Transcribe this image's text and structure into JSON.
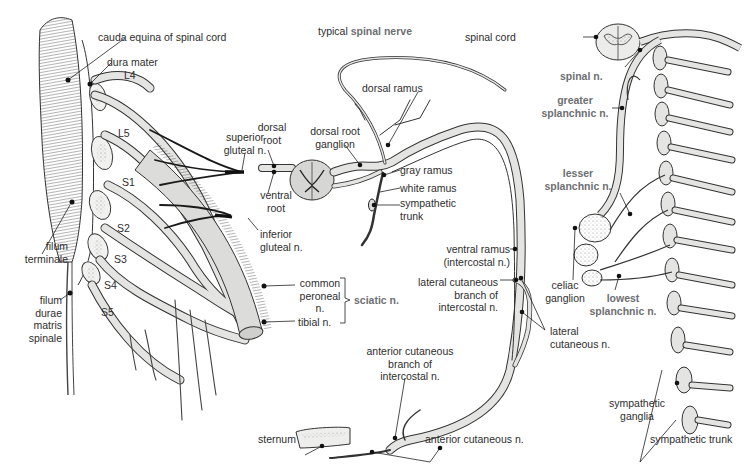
{
  "title": {
    "prefix": "typical ",
    "emphasis": "spinal nerve"
  },
  "colors": {
    "background": "#ffffff",
    "nerve_fill": "#e4e4e2",
    "outline": "#2a2a2a",
    "dark_nerve": "#1a1a1a",
    "emphasis_label": "#6d6f72",
    "text": "#2e2e2e"
  },
  "panels": {
    "sacral_plexus": {
      "labels": {
        "cauda_equina": "cauda equina of spinal cord",
        "dura_mater": "dura mater",
        "L4": "L4",
        "L5": "L5",
        "S1": "S1",
        "S2": "S2",
        "S3": "S3",
        "S4": "S4",
        "S5": "S5",
        "filum_terminale": "filum\nterminale",
        "filum_durae": "filum\ndurae\nmatris\nspinale",
        "superior_gluteal": "superior\ngluteal n.",
        "inferior_gluteal": "inferior\ngluteal n.",
        "common_peroneal": "common\nperoneal\nn.",
        "tibial": "tibial n.",
        "sciatic": "sciatic n."
      }
    },
    "typical_spinal_nerve": {
      "labels": {
        "dorsal_root": "dorsal\nroot",
        "dorsal_root_ganglion": "dorsal root\nganglion",
        "ventral_root": "ventral\nroot",
        "dorsal_ramus": "dorsal ramus",
        "gray_ramus": "gray ramus",
        "white_ramus": "white ramus",
        "sympathetic_trunk": "sympathetic\ntrunk",
        "ventral_ramus": "ventral ramus\n(intercostal n.)",
        "lateral_cutaneous_branch": "lateral cutaneous\nbranch of\nintercostal n.",
        "lateral_cutaneous_n": "lateral\ncutaneous n.",
        "anterior_cutaneous_branch": "anterior cutaneous\nbranch of\nintercostal n.",
        "anterior_cutaneous_n": "anterior cutaneous n.",
        "sternum": "sternum"
      }
    },
    "sympathetic_chain": {
      "labels": {
        "spinal_cord": "spinal cord",
        "spinal_n": "spinal n.",
        "greater_splanchnic": "greater\nsplanchnic n.",
        "lesser_splanchnic": "lesser\nsplanchnic n.",
        "celiac_ganglion": "celiac\nganglion",
        "lowest_splanchnic": "lowest\nsplanchnic n.",
        "sympathetic_ganglia": "sympathetic\nganglia",
        "sympathetic_trunk": "sympathetic trunk"
      }
    }
  }
}
